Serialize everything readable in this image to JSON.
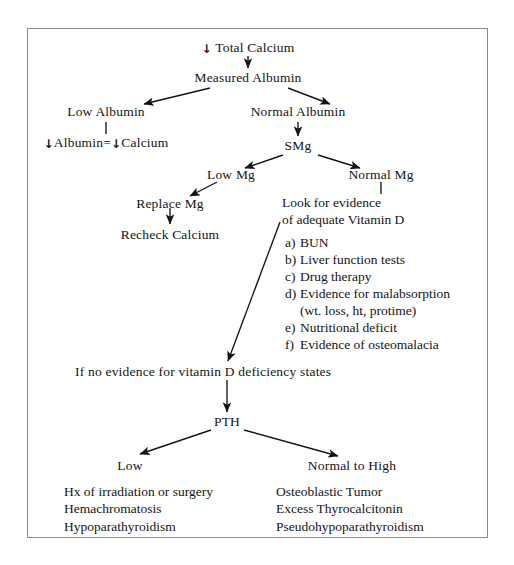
{
  "diagram": {
    "ink_color": "#141414",
    "border_color": "#8a8a8a",
    "background_color": "#ffffff",
    "down_arrow_glyph": "↓",
    "nodes": {
      "total_calcium": "Total Calcium",
      "total_calcium_prefix": "↓",
      "measured_albumin": "Measured Albumin",
      "low_albumin": "Low Albumin",
      "normal_albumin": "Normal Albumin",
      "albumin_equals_calcium_a": "↓Albumin",
      "albumin_equals_calcium_eq": "=",
      "albumin_equals_calcium_b": "↓Calcium",
      "smg": "SMg",
      "low_mg": "Low Mg",
      "normal_mg": "Normal Mg",
      "replace_mg": "Replace Mg",
      "recheck_calcium": "Recheck Calcium",
      "look_for_evidence_line1": "Look for evidence",
      "look_for_evidence_line2": "of adequate Vitamin D",
      "no_evidence": "If no evidence for vitamin D deficiency states",
      "pth": "PTH",
      "low": "Low",
      "normal_to_high": "Normal to High"
    },
    "evidence_list": [
      {
        "marker": "a)",
        "text": "BUN"
      },
      {
        "marker": "b)",
        "text": "Liver function tests"
      },
      {
        "marker": "c)",
        "text": "Drug therapy"
      },
      {
        "marker": "d)",
        "text": "Evidence for malabsorption"
      },
      {
        "marker": "",
        "text": "(wt. loss, ht, protime)",
        "sub": true
      },
      {
        "marker": "e)",
        "text": "Nutritional deficit"
      },
      {
        "marker": "f)",
        "text": "Evidence of osteomalacia"
      }
    ],
    "low_pth_causes": [
      "Hx of irradiation or surgery",
      "Hemachromatosis",
      "Hypoparathyroidism"
    ],
    "high_pth_causes": [
      "Osteoblastic Tumor",
      "Excess Thyrocalcitonin",
      "Pseudohypoparathyroidism"
    ]
  }
}
